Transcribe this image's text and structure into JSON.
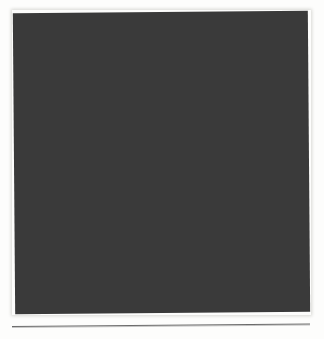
{
  "figure": {
    "name": "maze-pattern-figure",
    "type": "maze",
    "render": {
      "grid_columns": 98,
      "grid_rows": 100,
      "cell_pitch_px": 3,
      "wall_color": "#2b2b2b",
      "corridor_color": "#e8e8e6",
      "background_color": "#3a3a3a",
      "page_color": "#ffffff",
      "scan_rotation_deg": -0.45
    },
    "bounds": {
      "left_px": 14,
      "top_px": 12,
      "width_px": 295,
      "height_px": 301
    },
    "seed": 20240917
  },
  "rule": {
    "name": "figure-separator-rule",
    "color": "#6b6b6b",
    "left_px": 12,
    "top_px": 326,
    "width_px": 298,
    "thickness_px": 1,
    "rotation_deg": -0.5
  },
  "page": {
    "width_px": 324,
    "height_px": 339,
    "background": "#ffffff"
  }
}
